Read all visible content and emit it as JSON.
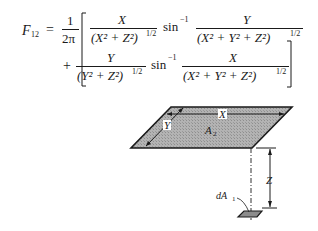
{
  "equation": {
    "lhs": "F",
    "lhs_sub": "12",
    "equals": "=",
    "prefactor_num": "1",
    "prefactor_den": "2π",
    "term1": {
      "num": "X",
      "den": "(X² + Z²)",
      "den_exp": "1/2",
      "func": "sin",
      "func_exp": "−1",
      "arg_num": "Y",
      "arg_den": "(X² + Y² + Z²)",
      "arg_den_exp": "1/2"
    },
    "plus": "+",
    "term2": {
      "num": "Y",
      "den": "(Y² + Z²)",
      "den_exp": "1/2",
      "func": "sin",
      "func_exp": "−1",
      "arg_num": "X",
      "arg_den": "(X² + Y² + Z²)",
      "arg_den_exp": "1/2"
    }
  },
  "diagram": {
    "label_x": "X",
    "label_y": "Y",
    "label_a2": "A",
    "label_a2_sub": "2",
    "label_z": "Z",
    "label_da1": "dA",
    "label_da1_sub": "1",
    "plate_fill": "#a9a9a9",
    "line_color": "#1a1a1a"
  }
}
